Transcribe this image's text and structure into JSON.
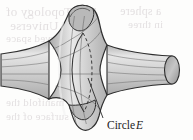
{
  "figure": {
    "kind": "3d-surface-illustration",
    "label": {
      "text_prefix": "Circle",
      "text_italic": "E",
      "full_text": "Circle E",
      "leader_line": "thin straight line from the label up to the waist circle"
    },
    "annotations": {
      "waist_circle_front": "solid arc on the front of the neck",
      "waist_circle_back": "dashed arc on the hidden back of the neck"
    },
    "colors": {
      "fill_light": "#d8d8d8",
      "fill_mid": "#c4c4c4",
      "fill_dark": "#a8a8a8",
      "fill_highlight": "#eaeaea",
      "outline": "#2b2b2b",
      "ruling_line": "#6e6e6e",
      "label_text": "#1c1c1c",
      "background": "#fdfdfc",
      "bleed_text": "#cfc9cc"
    }
  },
  "bleed_through": {
    "note": "faint mirrored text showing through from the reverse side of the printed page",
    "lines": [
      {
        "text": "The Topology of",
        "left": 6,
        "top": 4,
        "size": 13
      },
      {
        "text": "The Universe",
        "left": 10,
        "top": 18,
        "size": 13
      },
      {
        "text": "curved space",
        "left": 6,
        "top": 32,
        "size": 11
      },
      {
        "text": "manifold the",
        "left": 6,
        "top": 96,
        "size": 11
      },
      {
        "text": "surface of the",
        "left": 6,
        "top": 110,
        "size": 11
      },
      {
        "text": "a sphere",
        "left": 120,
        "top": 4,
        "size": 12
      },
      {
        "text": "in three",
        "left": 128,
        "top": 18,
        "size": 11
      }
    ]
  }
}
